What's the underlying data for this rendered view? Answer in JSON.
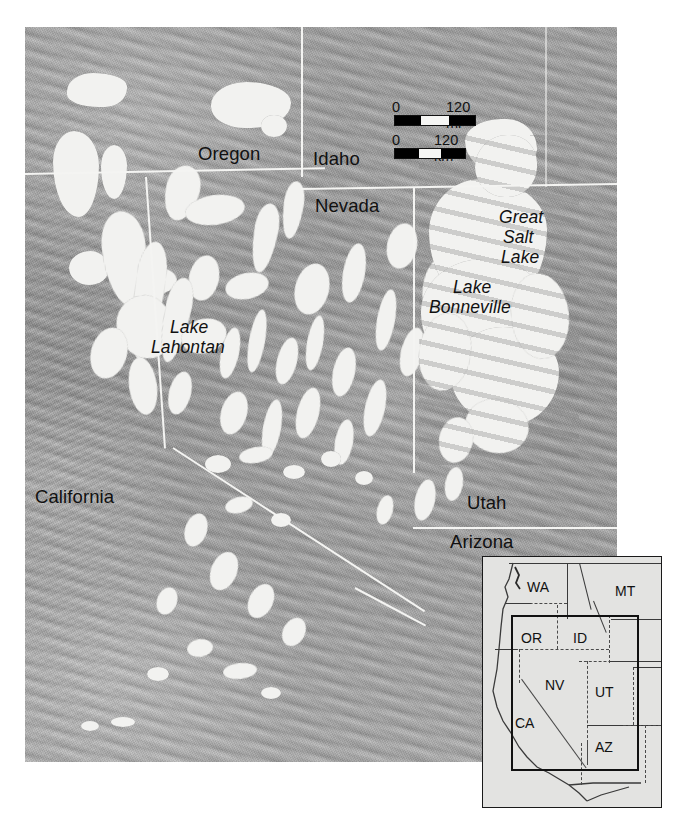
{
  "figure": {
    "type": "shaded-relief-map",
    "background_color": "#ffffff",
    "terrain_color": "#9d9d9d",
    "lake_color": "#f2f2f0",
    "border_color": "#f4f4f2",
    "label_color": "#111111"
  },
  "main_map": {
    "state_labels": [
      {
        "name": "Oregon",
        "text": "Oregon"
      },
      {
        "name": "Idaho",
        "text": "Idaho"
      },
      {
        "name": "Nevada",
        "text": "Nevada"
      },
      {
        "name": "California",
        "text": "California"
      },
      {
        "name": "Utah",
        "text": "Utah"
      },
      {
        "name": "Arizona",
        "text": "Arizona"
      }
    ],
    "lake_labels": [
      {
        "name": "great-salt-lake",
        "lines": [
          "Great",
          "Salt",
          "Lake"
        ]
      },
      {
        "name": "lake-bonneville",
        "lines": [
          "Lake",
          "Bonneville"
        ]
      },
      {
        "name": "lake-lahontan",
        "lines": [
          "Lake",
          "Lahontan"
        ]
      }
    ]
  },
  "scale_bars": [
    {
      "name": "miles-scale-bar",
      "zero": "0",
      "max": "120 mi",
      "segments": [
        "black",
        "white",
        "black"
      ]
    },
    {
      "name": "kilometers-scale-bar",
      "zero": "0",
      "max": "120 km",
      "segments": [
        "black",
        "white",
        "black"
      ]
    }
  ],
  "inset_map": {
    "name": "locator-inset",
    "states": [
      {
        "abbr": "WA"
      },
      {
        "abbr": "MT"
      },
      {
        "abbr": "OR"
      },
      {
        "abbr": "ID"
      },
      {
        "abbr": "NV"
      },
      {
        "abbr": "UT"
      },
      {
        "abbr": "CA"
      },
      {
        "abbr": "AZ"
      }
    ],
    "extent_box": "bold rectangle showing main map coverage"
  }
}
